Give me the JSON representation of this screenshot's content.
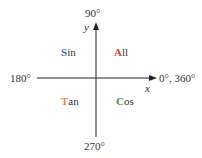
{
  "diagram": {
    "angles": {
      "top": "90°",
      "left": "180°",
      "right": "0°, 360°",
      "bottom": "270°"
    },
    "axes": {
      "x": "x",
      "y": "y"
    },
    "quadrants": [
      {
        "position": "top-left",
        "first_letter": "S",
        "rest": "in",
        "color": "#3b6fb6"
      },
      {
        "position": "top-right",
        "first_letter": "A",
        "rest": "ll",
        "color": "#d0452f"
      },
      {
        "position": "bottom-left",
        "first_letter": "T",
        "rest": "an",
        "color": "#e8883a"
      },
      {
        "position": "bottom-right",
        "first_letter": "C",
        "rest": "os",
        "color": "#3f8f3f"
      }
    ],
    "axis_color": "#222222"
  }
}
